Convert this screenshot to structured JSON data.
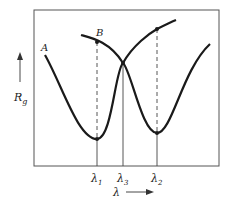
{
  "diagram": {
    "y_axis_label": "R",
    "y_axis_subscript": "g",
    "x_axis_label": "λ",
    "curves": [
      {
        "name": "A",
        "label": "A"
      },
      {
        "name": "B",
        "label": "B"
      }
    ],
    "ticks": [
      {
        "base": "λ",
        "sub": "1"
      },
      {
        "base": "λ",
        "sub": "3"
      },
      {
        "base": "λ",
        "sub": "2"
      }
    ],
    "colors": {
      "curve": "#1a1a1a",
      "frame": "#555555",
      "guide": "#444444"
    }
  }
}
